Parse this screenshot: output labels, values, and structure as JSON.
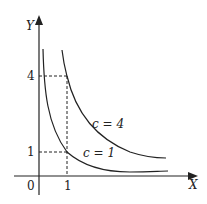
{
  "diagram": {
    "axes": {
      "x_label": "X",
      "y_label": "Y",
      "origin_label": "0"
    },
    "ticks": {
      "x": [
        "1"
      ],
      "y": [
        "4",
        "1"
      ]
    },
    "curves": [
      {
        "name": "c=4",
        "label": "c = 4",
        "equation": "xy = 4"
      },
      {
        "name": "c=1",
        "label": "c = 1",
        "equation": "xy = 1"
      }
    ],
    "guides": [
      {
        "from": "y=4",
        "to": "x=1",
        "style": "dashed"
      },
      {
        "from": "y=1",
        "to": "x=1",
        "style": "dashed"
      }
    ],
    "colors": {
      "stroke": "#222222",
      "background": "#ffffff"
    }
  }
}
